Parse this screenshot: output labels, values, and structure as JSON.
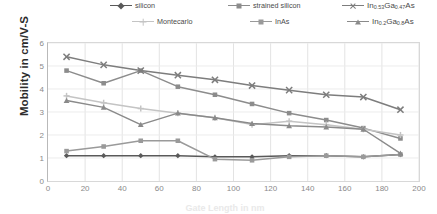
{
  "chart_data": {
    "type": "line",
    "title": "",
    "xlabel": "Gate Length in nm",
    "ylabel": "Mobility in cm/V-S",
    "xlim": [
      0,
      200
    ],
    "ylim": [
      0,
      6
    ],
    "xticks": [
      0,
      20,
      40,
      60,
      80,
      100,
      120,
      140,
      160,
      180,
      200
    ],
    "yticks": [
      0,
      1,
      2,
      3,
      4,
      5,
      6
    ],
    "grid": true,
    "legend_position": "top",
    "x": [
      10,
      30,
      50,
      70,
      90,
      110,
      130,
      150,
      170,
      190
    ],
    "series": [
      {
        "name": "silicon",
        "marker": "diamond",
        "color": "#595959",
        "values": [
          1.1,
          1.1,
          1.1,
          1.1,
          1.05,
          1.05,
          1.1,
          1.1,
          1.05,
          1.15
        ]
      },
      {
        "name": "strained silicon",
        "marker": "square",
        "color": "#8c8c8c",
        "values": [
          4.8,
          4.25,
          4.8,
          4.1,
          3.75,
          3.35,
          2.95,
          2.65,
          2.3,
          1.85
        ]
      },
      {
        "name": "In0.53Ga0.47As",
        "marker": "cross",
        "color": "#7d7d7d",
        "values": [
          5.4,
          5.05,
          4.8,
          4.6,
          4.4,
          4.15,
          3.95,
          3.75,
          3.65,
          3.1
        ]
      },
      {
        "name": "Montecarlo",
        "marker": "plus",
        "color": "#c4c4c4",
        "values": [
          3.7,
          3.4,
          3.15,
          2.95,
          2.75,
          2.45,
          2.6,
          2.45,
          2.25,
          2.0
        ]
      },
      {
        "name": "InAs",
        "marker": "square",
        "color": "#9a9a9a",
        "values": [
          1.3,
          1.5,
          1.75,
          1.75,
          0.95,
          0.9,
          1.05,
          1.1,
          1.05,
          1.15
        ]
      },
      {
        "name": "In0.2Ga0.8As",
        "marker": "triangle",
        "color": "#8a8a8a",
        "values": [
          3.5,
          3.2,
          2.45,
          2.95,
          2.75,
          2.5,
          2.4,
          2.35,
          2.25,
          1.2
        ]
      }
    ],
    "legend": [
      {
        "label": "silicon",
        "marker": "diamond",
        "color": "#595959",
        "chem": false
      },
      {
        "label": "strained silicon",
        "marker": "square",
        "color": "#8c8c8c",
        "chem": false
      },
      {
        "label": "In0.53Ga0.47As",
        "marker": "cross",
        "color": "#7d7d7d",
        "chem": true,
        "parts": [
          "In",
          "0.53",
          "Ga",
          "0.47",
          "As"
        ]
      },
      {
        "label": "Montecarlo",
        "marker": "plus",
        "color": "#c4c4c4",
        "chem": false
      },
      {
        "label": "InAs",
        "marker": "square",
        "color": "#9a9a9a",
        "chem": false
      },
      {
        "label": "In0.2Ga0.8As",
        "marker": "triangle",
        "color": "#8a8a8a",
        "chem": true,
        "parts": [
          "In",
          "0.2",
          "Ga",
          "0.8",
          "As"
        ]
      }
    ]
  },
  "axis": {
    "ylabel_text": "Mobility in cm/V-S",
    "xlabel_text": "Gate Length in nm"
  }
}
